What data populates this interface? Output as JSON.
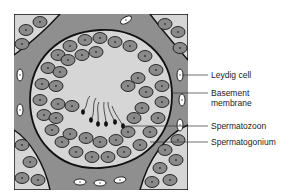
{
  "figure": {
    "colors": {
      "background": "#ffffff",
      "interstitial": "#8f8f8f",
      "lumen": "#d6d6d6",
      "cell_fill": "#8a8a8a",
      "cell_outline": "#1a1a1a",
      "leydig_fill": "#ffffff",
      "membrane": "#111111",
      "leader": "#333333"
    }
  },
  "labels": [
    {
      "id": "leydig",
      "text": "Leydig cell"
    },
    {
      "id": "basement1",
      "text": "Basement"
    },
    {
      "id": "basement2",
      "text": "membrane"
    },
    {
      "id": "spermatozoon",
      "text": "Spermatozoon"
    },
    {
      "id": "spermatogonium",
      "text": "Spermatogonium"
    }
  ]
}
